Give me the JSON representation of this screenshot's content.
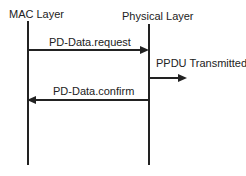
{
  "diagram": {
    "type": "sequence-diagram",
    "background": "#ffffff",
    "line_color": "#222222",
    "text_color": "#222222",
    "actors": [
      {
        "id": "mac",
        "label": "MAC Layer"
      },
      {
        "id": "phy",
        "label": "Physical Layer"
      }
    ],
    "messages": [
      {
        "id": "pd-data-request",
        "label": "PD-Data.request",
        "from": "mac",
        "to": "phy",
        "arrow": "right"
      },
      {
        "id": "ppdu-transmitted",
        "label": "PPDU Transmitted",
        "from": "phy",
        "to": "external",
        "arrow": "right"
      },
      {
        "id": "pd-data-confirm",
        "label": "PD-Data.confirm",
        "from": "phy",
        "to": "mac",
        "arrow": "left"
      }
    ]
  }
}
